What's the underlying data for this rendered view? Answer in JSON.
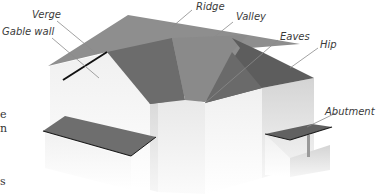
{
  "diagram": {
    "labels": [
      {
        "id": "verge",
        "text": "Verge"
      },
      {
        "id": "gable-wall",
        "text": "Gable wall"
      },
      {
        "id": "ridge",
        "text": "Ridge"
      },
      {
        "id": "valley",
        "text": "Valley"
      },
      {
        "id": "eaves",
        "text": "Eaves"
      },
      {
        "id": "hip",
        "text": "Hip"
      },
      {
        "id": "abutment",
        "text": "Abutment"
      }
    ],
    "cropped_text_fragments": [
      "e",
      "n",
      "s"
    ],
    "colors": {
      "roof_light": "#8c8c8c",
      "roof_mid": "#7a7a7a",
      "roof_dark": "#5e5e5e",
      "wall_light": "#f2f2f2",
      "wall_mid": "#e2e2e2",
      "wall_shade": "#cfcfcf",
      "leader": "#8a8a8a",
      "verge_line": "#111111"
    }
  }
}
